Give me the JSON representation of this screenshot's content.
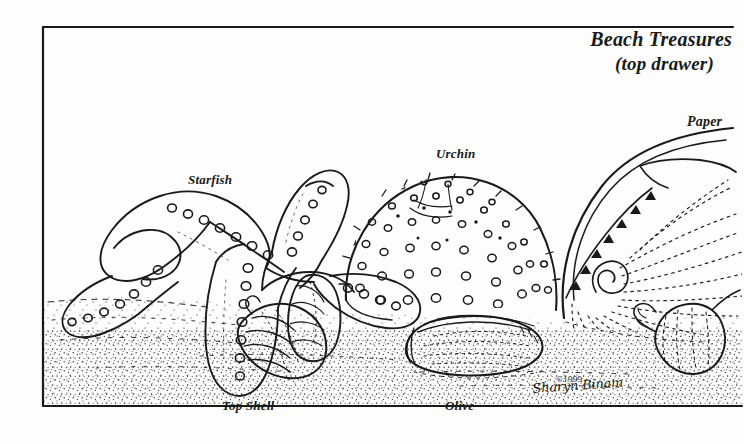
{
  "image": {
    "kind": "pen-and-ink line illustration",
    "width": 744,
    "height": 444,
    "background_color": "#fdfdfc",
    "ink_color": "#1a1a1a"
  },
  "title": {
    "line1": "Beach Treasures",
    "line2": "(top drawer)"
  },
  "labels": {
    "starfish": "Starfish",
    "urchin": "Urchin",
    "paper": "Paper",
    "top_shell": "Top Shell",
    "olive": "Olive"
  },
  "credit": {
    "copyright": "©1999",
    "signature": "Sharyn Binam"
  },
  "frame": {
    "left_x": 43,
    "top_y": 27,
    "bottom_y": 406,
    "top_right_x": 733,
    "bottom_right_x": 742,
    "stroke": "#1a1a1a",
    "stroke_width": 2.2
  },
  "subjects": [
    {
      "name": "starfish",
      "description": "sea star with five thick arms covered in small ring-shaped tubercles, left of centre"
    },
    {
      "name": "sea-urchin",
      "description": "domed urchin test covered with radiating rows of small circular tubercles, centre"
    },
    {
      "name": "paper-nautilus",
      "description": "argonaut paper shell with spiral keel and radiating dotted ribs, right"
    },
    {
      "name": "top-shell",
      "description": "conical banded spiral shell resting on sand, lower left of centre"
    },
    {
      "name": "olive-shell",
      "description": "elongated oval olive shell with dotted seam lines, bottom centre"
    },
    {
      "name": "small-spiral-shell",
      "description": "small auger/turret shell, lower right"
    },
    {
      "name": "sand",
      "description": "stippled sand bed running across the lower third"
    }
  ]
}
